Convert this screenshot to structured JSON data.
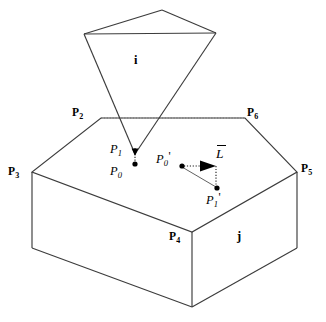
{
  "figure": {
    "background_color": "#ffffff",
    "line_color": "#3c3c3c",
    "accent_color": "#000000",
    "width": 326,
    "height": 322
  },
  "labels": {
    "face_i": "i",
    "face_j": "j",
    "p2": "P",
    "p2_sub": "2",
    "p3": "P",
    "p3_sub": "3",
    "p4": "P",
    "p4_sub": "4",
    "p5": "P",
    "p5_sub": "5",
    "p6": "P",
    "p6_sub": "6",
    "p0": "P",
    "p0_sub": "0",
    "p1": "P",
    "p1_sub": "1",
    "p0prime": "P",
    "p0prime_sub": "0",
    "p0prime_mark": "'",
    "p1prime": "P",
    "p1prime_sub": "1",
    "p1prime_mark": "'",
    "vector_l": "L"
  },
  "geometry": {
    "cone": {
      "apex_top": [
        162,
        10
      ],
      "rim_left": [
        84,
        34
      ],
      "rim_right": [
        216,
        33
      ],
      "tip": [
        135,
        154
      ]
    },
    "slab_top_face": [
      [
        101,
        118
      ],
      [
        245,
        118
      ],
      [
        297,
        172
      ],
      [
        192,
        232
      ],
      [
        32,
        172
      ]
    ],
    "slab_bottom_edges": [
      [
        32,
        172,
        32,
        248
      ],
      [
        192,
        232,
        192,
        307
      ],
      [
        297,
        172,
        297,
        248
      ]
    ],
    "slab_bottom_outline": [
      [
        32,
        248
      ],
      [
        192,
        307
      ],
      [
        297,
        248
      ]
    ],
    "points": {
      "p0": [
        135,
        164
      ],
      "p1_tip": [
        135,
        154
      ],
      "p0_prime": [
        182,
        166
      ],
      "p1_prime": [
        217,
        188
      ]
    },
    "vector_arrow": {
      "from": [
        182,
        166
      ],
      "to": [
        216,
        166
      ]
    }
  }
}
